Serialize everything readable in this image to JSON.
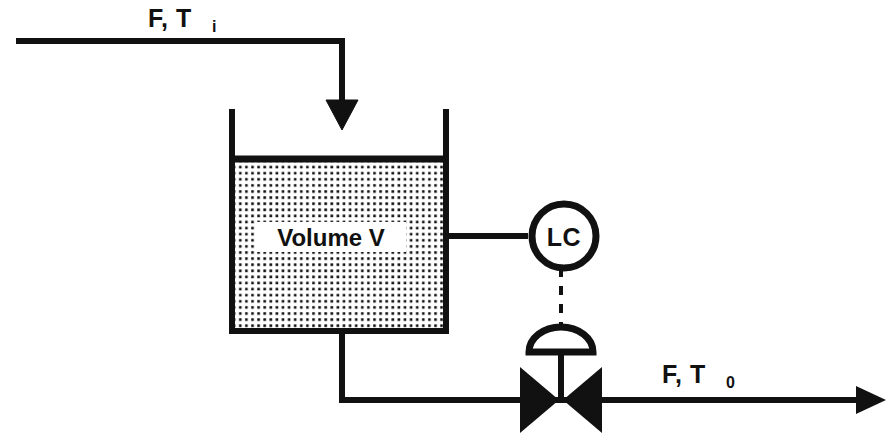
{
  "diagram": {
    "background_color": "#ffffff",
    "line_color": "#111111",
    "fill_pattern": "dot-grid"
  },
  "streams": {
    "inlet": {
      "label_main": "F, T",
      "label_sub": "i",
      "full_label": "F, Ti",
      "direction": "down-into-tank"
    },
    "outlet": {
      "label_main": "F, T",
      "label_sub": "0",
      "full_label": "F, T0",
      "direction": "right"
    }
  },
  "vessel": {
    "label": "Volume V",
    "fill": "dotted-liquid"
  },
  "controller": {
    "tag": "LC",
    "shape": "circle-bubble",
    "signal_type": "dashed"
  },
  "valve": {
    "type": "globe-control-valve",
    "actuator": "diaphragm-dome",
    "body": "bowtie"
  }
}
